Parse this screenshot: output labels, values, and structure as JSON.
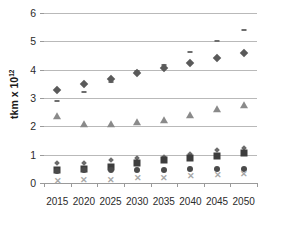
{
  "chart_data": {
    "type": "scatter",
    "title": "",
    "xlabel": "",
    "ylabel": "tkm  x 10",
    "ylabel_exponent": "12",
    "categories": [
      "2015",
      "2020",
      "2025",
      "2030",
      "2035",
      "2040",
      "2045",
      "2050"
    ],
    "x": [
      2015,
      2020,
      2025,
      2030,
      2035,
      2040,
      2045,
      2050
    ],
    "ylim": [
      0,
      6
    ],
    "yticks": [
      0,
      1,
      2,
      3,
      4,
      5,
      6
    ],
    "ytick_labels": [
      "0",
      "1",
      "2",
      "3",
      "4",
      "5",
      "6"
    ],
    "grid": true,
    "grid_axis": "y",
    "legend": "none",
    "series": [
      {
        "name": "series-dash-upper",
        "marker": "dash",
        "color": "#6e6e6e",
        "values": [
          2.9,
          3.2,
          3.55,
          3.95,
          4.18,
          4.62,
          5.0,
          5.4
        ]
      },
      {
        "name": "series-diamond-large",
        "marker": "diamond",
        "color": "#5a5a5a",
        "values": [
          3.3,
          3.5,
          3.68,
          3.88,
          4.05,
          4.24,
          4.42,
          4.6
        ]
      },
      {
        "name": "series-triangle",
        "marker": "triangle",
        "color": "#8a8a8a",
        "values": [
          2.35,
          2.08,
          2.08,
          2.15,
          2.23,
          2.4,
          2.6,
          2.75
        ]
      },
      {
        "name": "series-diamond-small",
        "marker": "diamond-small",
        "color": "#6b6b6b",
        "values": [
          0.7,
          0.72,
          0.8,
          0.88,
          0.93,
          1.02,
          1.15,
          1.22
        ]
      },
      {
        "name": "series-square",
        "marker": "square",
        "color": "#3d3d3d",
        "values": [
          0.45,
          0.5,
          0.58,
          0.72,
          0.8,
          0.88,
          0.95,
          1.05
        ]
      },
      {
        "name": "series-circle",
        "marker": "circle",
        "color": "#4a4a4a",
        "values": [
          0.42,
          0.46,
          0.47,
          0.47,
          0.47,
          0.48,
          0.48,
          0.48
        ]
      },
      {
        "name": "series-x-lower",
        "marker": "x",
        "color": "#a8a8a8",
        "values": [
          0.07,
          0.09,
          0.12,
          0.16,
          0.19,
          0.23,
          0.27,
          0.31
        ]
      }
    ]
  }
}
